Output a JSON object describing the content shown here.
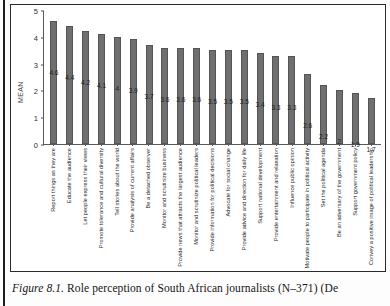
{
  "figure": {
    "caption_label": "Figure 8.1.",
    "caption_text": "Role perception of South African journalists (N–371) (De"
  },
  "chart_data": {
    "type": "bar",
    "title": "",
    "xlabel": "",
    "ylabel": "MEAN",
    "ylim": [
      0,
      5
    ],
    "yticks": [
      0,
      1,
      2,
      3,
      4,
      5
    ],
    "grid": false,
    "legend": "none",
    "bar_color": "#6f6f6f",
    "categories": [
      "Report things as they are",
      "Educate the audience",
      "Let people express their views",
      "Promote tolerance and cultural diversity",
      "Tell stories about the world",
      "Provide analysis of current affairs",
      "Be a detached observer",
      "Monitor and scrutinize business",
      "Provide news that attracts the largest audience",
      "Monitor and scrutinize political leaders",
      "Provide information for political decisions",
      "Advocate for social change",
      "Provide advice and direction for daily life",
      "Support national development",
      "Provide entertainment and relaxation",
      "Influence public opinion",
      "Motivate people to participate in political activity",
      "Set the political agenda",
      "Be an adversary of the government",
      "Support government policy",
      "Convey a positive image of political leadership"
    ],
    "values": [
      4.6,
      4.4,
      4.2,
      4.1,
      4,
      3.9,
      3.7,
      3.6,
      3.6,
      3.6,
      3.5,
      3.5,
      3.5,
      3.4,
      3.3,
      3.3,
      2.6,
      2.2,
      2,
      1.9,
      1.7
    ],
    "value_labels": [
      "4.6",
      "4.4",
      "4.2",
      "4.1",
      "4",
      "3.9",
      "3.7",
      "3.6",
      "3.6",
      "3.6",
      "3.5",
      "3.5",
      "3.5",
      "3.4",
      "3.3",
      "3.3",
      "2.6",
      "2.2",
      "2",
      "1.9",
      "1.7"
    ]
  }
}
